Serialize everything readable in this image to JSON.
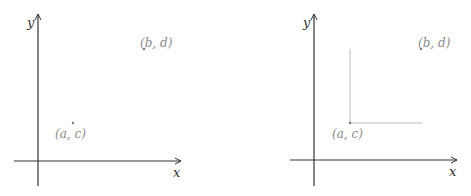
{
  "panels": [
    {
      "id": "left",
      "axis_labels": {
        "x": "x",
        "y": "y"
      },
      "points": [
        {
          "label": "(a, c)"
        },
        {
          "label": "(b, d)"
        }
      ],
      "guide_lines": false
    },
    {
      "id": "right",
      "axis_labels": {
        "x": "x",
        "y": "y"
      },
      "points": [
        {
          "label": "(a, c)"
        },
        {
          "label": "(b, d)"
        }
      ],
      "guide_lines": true
    }
  ],
  "colors": {
    "axis": "#333333",
    "point": "#777777",
    "label": "#8a8a8a",
    "guide": "#bdbdbd"
  }
}
